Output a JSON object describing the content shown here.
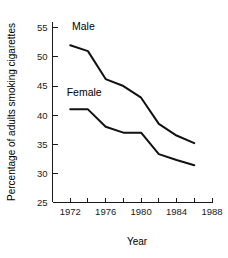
{
  "chart_data": {
    "type": "line",
    "title": "",
    "xlabel": "Year",
    "ylabel": "Percentage of adults smoking cigarettes",
    "x": [
      1972,
      1974,
      1976,
      1978,
      1980,
      1982,
      1984,
      1986
    ],
    "xlim": [
      1970,
      1988
    ],
    "ylim": [
      25,
      56
    ],
    "grid": false,
    "legend_position": "inline-annotation",
    "x_tick_labels": [
      "1972",
      "1976",
      "1980",
      "1984",
      "1988"
    ],
    "x_tick_values": [
      1972,
      1976,
      1980,
      1984,
      1988
    ],
    "x_minor_tick_values": [
      1972,
      1974,
      1976,
      1978,
      1980,
      1982,
      1984,
      1986,
      1988
    ],
    "y_tick_labels": [
      "25",
      "30",
      "35",
      "40",
      "45",
      "50",
      "55"
    ],
    "y_tick_values": [
      25,
      30,
      35,
      40,
      45,
      50,
      55
    ],
    "series": [
      {
        "name": "Male",
        "label_text": "Male",
        "values": [
          52.0,
          51.0,
          46.2,
          45.0,
          43.0,
          38.5,
          36.5,
          35.2
        ]
      },
      {
        "name": "Female",
        "label_text": "Female",
        "values": [
          41.0,
          41.0,
          38.0,
          37.0,
          37.0,
          33.3,
          32.3,
          31.4
        ]
      }
    ],
    "annotations": [
      {
        "text": "Male",
        "x": 1972.2,
        "y": 54.6
      },
      {
        "text": "Female",
        "x": 1971.6,
        "y": 43.3
      }
    ],
    "colors": {
      "line": "#111111",
      "axis": "#1a1a1a",
      "background": "#ffffff",
      "text": "#000000"
    }
  }
}
